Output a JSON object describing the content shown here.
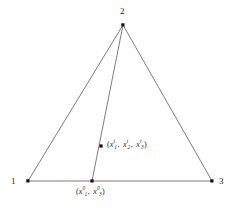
{
  "figure": {
    "type": "geometry-diagram",
    "background_color": "#ffffff",
    "line_color": "#6b6b6b",
    "point_color": "#111111",
    "text_color": "#1f1f1f"
  },
  "vertices": [
    {
      "id": "v1",
      "label": "1",
      "x": 28,
      "y": 181,
      "label_x": 11,
      "label_y": 177
    },
    {
      "id": "v2",
      "label": "2",
      "x": 123,
      "y": 25,
      "label_x": 120,
      "label_y": 7
    },
    {
      "id": "v3",
      "label": "3",
      "x": 212,
      "y": 181,
      "label_x": 219,
      "label_y": 177
    }
  ],
  "points": [
    {
      "id": "base-point",
      "x": 92,
      "y": 181,
      "label": {
        "open": "(",
        "terms": [
          {
            "base": "x",
            "sub": "1",
            "sup": "0"
          },
          {
            "base": "x",
            "sub": "3",
            "sup": "0"
          }
        ],
        "close": ")",
        "separator": ",",
        "text": "(x₁⁰, x₃⁰)"
      },
      "label_x": 76,
      "label_y": 188
    },
    {
      "id": "interior-point",
      "x": 101,
      "y": 146,
      "label": {
        "open": "(",
        "terms": [
          {
            "base": "x",
            "sub": "1",
            "sup": "t"
          },
          {
            "base": "x",
            "sub": "2",
            "sup": "t"
          },
          {
            "base": "x",
            "sub": "3",
            "sup": "t"
          }
        ],
        "close": ")",
        "separator": ",",
        "text": "(x₁ᵗ, x₂ᵗ, x₃ᵗ)"
      },
      "label_x": 107,
      "label_y": 141
    }
  ],
  "edges": [
    {
      "id": "edge-1-2",
      "from": "v1",
      "to": "v2"
    },
    {
      "id": "edge-2-3",
      "from": "v2",
      "to": "v3"
    },
    {
      "id": "edge-1-3",
      "from": "v1",
      "to": "v3"
    },
    {
      "id": "cevian-2-base",
      "from": "v2",
      "to": "base-point"
    }
  ]
}
